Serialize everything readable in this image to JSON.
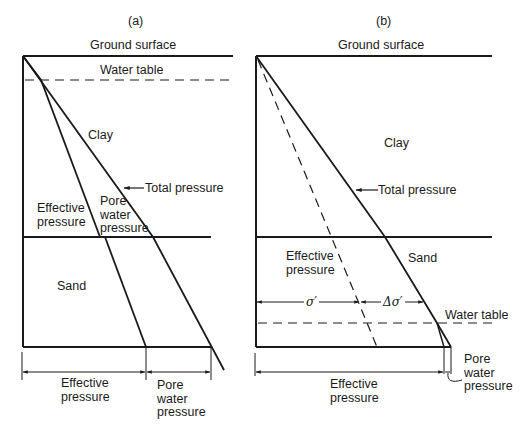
{
  "panels": [
    {
      "id": "a",
      "title": "(a)",
      "labels": {
        "ground_surface": "Ground surface",
        "water_table": "Water table",
        "clay": "Clay",
        "total_pressure": "Total pressure",
        "effective_pressure_line1": "Effective",
        "effective_pressure_line2": "pressure",
        "pore_water_line1": "Pore",
        "pore_water_line2": "water",
        "pore_water_line3": "pressure",
        "sand": "Sand",
        "dim_effective_line1": "Effective",
        "dim_effective_line2": "pressure",
        "dim_pore_line1": "Pore",
        "dim_pore_line2": "water",
        "dim_pore_line3": "pressure"
      }
    },
    {
      "id": "b",
      "title": "(b)",
      "labels": {
        "ground_surface": "Ground surface",
        "clay": "Clay",
        "total_pressure": "Total pressure",
        "effective_pressure_line1": "Effective",
        "effective_pressure_line2": "pressure",
        "sand": "Sand",
        "sigma_prime": "σ′",
        "delta_sigma_prime": "Δσ′",
        "water_table": "Water table",
        "dim_effective_line1": "Effective",
        "dim_effective_line2": "pressure",
        "dim_pore_line1": "Pore",
        "dim_pore_line2": "water",
        "dim_pore_line3": "pressure"
      }
    }
  ],
  "colors": {
    "ink": "#1a1a1a",
    "background": "#ffffff"
  }
}
